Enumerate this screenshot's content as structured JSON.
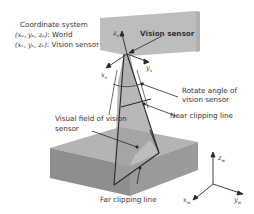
{
  "legend": {
    "title": "Coordinate system",
    "world": {
      "coords": "(xᵤ, yᵤ, zᵤ)",
      "label": ": World"
    },
    "sensor": {
      "coords": "(xᵥ, yᵥ, zᵥ)",
      "label": ": Vision sensor"
    }
  },
  "labels": {
    "vision_sensor": "Vision sensor",
    "rotate_angle_1": "Rotate angle of",
    "rotate_angle_2": "vision sensor",
    "near_clipping": "Near clipping line",
    "visual_field_1": "Visual field of vision",
    "visual_field_2": "sensor",
    "far_clipping": "Far clipping line"
  },
  "sensor_axes": {
    "z": "z",
    "x": "x",
    "y": "y",
    "sub": "v"
  },
  "world_axes": {
    "z": "z",
    "x": "x",
    "y": "y",
    "sub": "w"
  },
  "colors": {
    "wall": "#bdbdbd",
    "cone": "#a8a8a8",
    "box_top": "#b4b4b4",
    "box_front": "#8e8e8e",
    "box_side": "#9a9a9a",
    "box_highlight": "#c8c8c8",
    "ink": "#2a2a2a"
  }
}
